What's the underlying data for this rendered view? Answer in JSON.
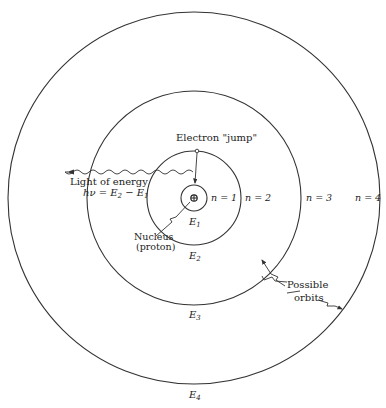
{
  "diagram": {
    "orbits": [
      {
        "n_label": "n = 1",
        "energy_label": "E",
        "energy_sub": "1"
      },
      {
        "n_label": "n = 2",
        "energy_label": "E",
        "energy_sub": "2"
      },
      {
        "n_label": "n = 3",
        "energy_label": "E",
        "energy_sub": "3"
      },
      {
        "n_label": "n = 4",
        "energy_label": "E",
        "energy_sub": "4"
      }
    ],
    "labels": {
      "electron_jump": "Electron \"jump\"",
      "light_line1": "Light of energy",
      "light_eq_prefix": "hν = E",
      "light_eq_sub1": "2",
      "light_eq_mid": " − E",
      "light_eq_sub2": "1",
      "nucleus_line1": "Nucleus",
      "nucleus_line2": "(proton)",
      "possible_line1": "Possible",
      "possible_line2": "orbits"
    },
    "colors": {
      "ink": "#333333",
      "background": "#ffffff"
    }
  }
}
